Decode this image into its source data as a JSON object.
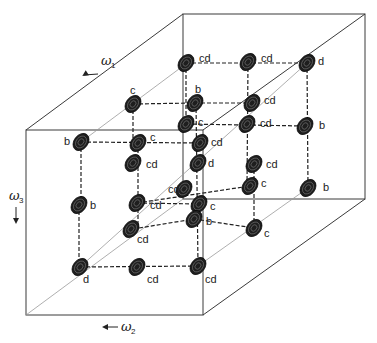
{
  "figure": {
    "type": "3D NMR spectrum cube schematic",
    "axes": [
      {
        "id": "w1",
        "symbol": "ω",
        "subscript": "1",
        "direction": "arrow pointing left-down along depth axis"
      },
      {
        "id": "w2",
        "symbol": "ω",
        "subscript": "2",
        "direction": "arrow pointing left"
      },
      {
        "id": "w3",
        "symbol": "ω",
        "subscript": "3",
        "direction": "arrow pointing down"
      }
    ],
    "colors": {
      "edge": "#3a3a3a",
      "peak": "#1e1e1e",
      "background": "#ffffff"
    },
    "peaks": [
      {
        "label": "c",
        "x": 133,
        "y": 104,
        "lx": 130,
        "ly": 94
      },
      {
        "label": "cd",
        "x": 186,
        "y": 63,
        "lx": 199,
        "ly": 62
      },
      {
        "label": "cd",
        "x": 248,
        "y": 62,
        "lx": 261,
        "ly": 62
      },
      {
        "label": "d",
        "x": 307,
        "y": 63,
        "lx": 318,
        "ly": 65
      },
      {
        "label": "b",
        "x": 195,
        "y": 103,
        "lx": 195,
        "ly": 93
      },
      {
        "label": "cd",
        "x": 252,
        "y": 103,
        "lx": 264,
        "ly": 104
      },
      {
        "label": "c",
        "x": 186,
        "y": 124,
        "lx": 198,
        "ly": 126
      },
      {
        "label": "cd",
        "x": 247,
        "y": 124,
        "lx": 260,
        "ly": 127
      },
      {
        "label": "b",
        "x": 305,
        "y": 126,
        "lx": 319,
        "ly": 129
      },
      {
        "label": "b",
        "x": 81,
        "y": 142,
        "lx": 64,
        "ly": 145
      },
      {
        "label": "c",
        "x": 138,
        "y": 143,
        "lx": 150,
        "ly": 141
      },
      {
        "label": "cd",
        "x": 133,
        "y": 163,
        "lx": 146,
        "ly": 168
      },
      {
        "label": "cd",
        "x": 200,
        "y": 143,
        "lx": 211,
        "ly": 146
      },
      {
        "label": "d",
        "x": 198,
        "y": 163,
        "lx": 208,
        "ly": 167
      },
      {
        "label": "cd",
        "x": 254,
        "y": 164,
        "lx": 266,
        "ly": 168
      },
      {
        "label": "b",
        "x": 79,
        "y": 205,
        "lx": 90,
        "ly": 209
      },
      {
        "label": "cd",
        "x": 137,
        "y": 203,
        "lx": 150,
        "ly": 209
      },
      {
        "label": "cd",
        "x": 184,
        "y": 189,
        "lx": 168,
        "ly": 193
      },
      {
        "label": "c",
        "x": 250,
        "y": 186,
        "lx": 261,
        "ly": 187
      },
      {
        "label": "b",
        "x": 308,
        "y": 188,
        "lx": 323,
        "ly": 191
      },
      {
        "label": "cd",
        "x": 131,
        "y": 229,
        "lx": 137,
        "ly": 243
      },
      {
        "label": "c",
        "x": 199,
        "y": 204,
        "lx": 210,
        "ly": 210
      },
      {
        "label": "b",
        "x": 194,
        "y": 219,
        "lx": 206,
        "ly": 225
      },
      {
        "label": "c",
        "x": 254,
        "y": 228,
        "lx": 264,
        "ly": 237
      },
      {
        "label": "d",
        "x": 80,
        "y": 267,
        "lx": 83,
        "ly": 283
      },
      {
        "label": "cd",
        "x": 137,
        "y": 267,
        "lx": 147,
        "ly": 283
      },
      {
        "label": "cd",
        "x": 198,
        "y": 266,
        "lx": 205,
        "ly": 283
      }
    ],
    "connectors": [
      [
        133,
        104,
        195,
        103
      ],
      [
        186,
        63,
        307,
        63
      ],
      [
        195,
        103,
        252,
        103
      ],
      [
        186,
        124,
        305,
        126
      ],
      [
        81,
        142,
        200,
        143
      ],
      [
        137,
        203,
        250,
        186
      ],
      [
        79,
        205,
        79,
        267
      ],
      [
        80,
        267,
        198,
        266
      ],
      [
        137,
        203,
        199,
        204
      ],
      [
        138,
        143,
        138,
        229
      ],
      [
        133,
        104,
        133,
        143
      ],
      [
        194,
        219,
        254,
        228
      ],
      [
        81,
        142,
        81,
        205
      ],
      [
        186,
        63,
        186,
        124
      ],
      [
        248,
        62,
        247,
        186
      ],
      [
        307,
        63,
        308,
        188
      ],
      [
        196,
        103,
        198,
        266
      ],
      [
        254,
        164,
        254,
        228
      ],
      [
        133,
        229,
        194,
        219
      ]
    ]
  }
}
